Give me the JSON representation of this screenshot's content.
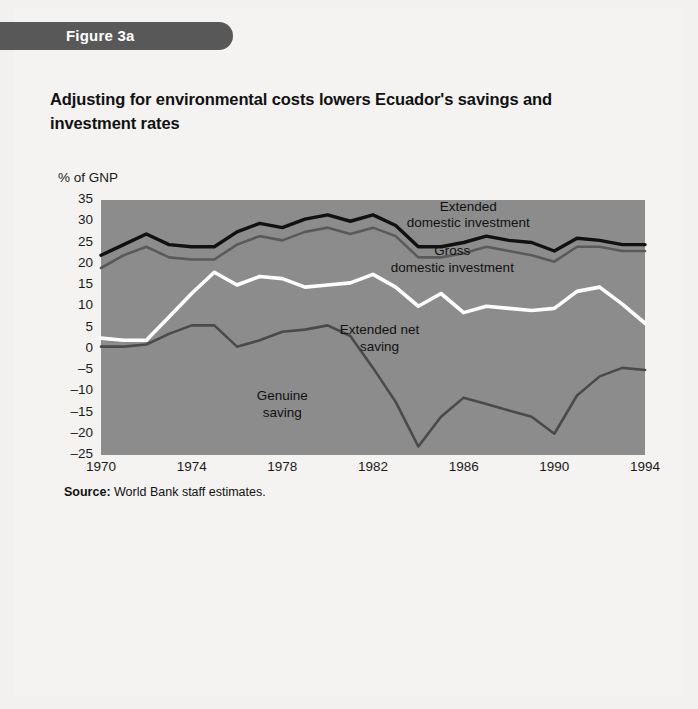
{
  "figure": {
    "tab_label": "Figure 3a",
    "title": "Adjusting for environmental costs lowers Ecuador's savings and investment rates",
    "source_prefix": "Source:",
    "source_text": "World Bank staff estimates."
  },
  "colors": {
    "tab_background": "#585858",
    "plot_background": "#8c8c8c",
    "extended_domestic_investment": "#111111",
    "gross_domestic_investment": "#5a5a5a",
    "extended_net_saving": "#ffffff",
    "genuine_saving": "#4a4a4a",
    "page_background": "#f4f3f1",
    "text": "#111111"
  },
  "chart_data": {
    "type": "line",
    "title": "Adjusting for environmental costs lowers Ecuador's savings and investment rates",
    "subtitle": "",
    "xlabel": "",
    "ylabel": "% of GNP",
    "ylim": [
      -25,
      35
    ],
    "xlim": [
      1970,
      1994
    ],
    "grid": false,
    "legend_position": "inline-annotations",
    "ytick_labels": [
      "35",
      "30",
      "25",
      "20",
      "15",
      "10",
      "5",
      "0",
      "–5",
      "–10",
      "–15",
      "–20",
      "–25"
    ],
    "ytick_values": [
      35,
      30,
      25,
      20,
      15,
      10,
      5,
      0,
      -5,
      -10,
      -15,
      -20,
      -25
    ],
    "xtick_labels": [
      "1970",
      "1974",
      "1978",
      "1982",
      "1986",
      "1990",
      "1994"
    ],
    "xtick_values": [
      1970,
      1974,
      1978,
      1982,
      1986,
      1990,
      1994
    ],
    "x": [
      1970,
      1971,
      1972,
      1973,
      1974,
      1975,
      1976,
      1977,
      1978,
      1979,
      1980,
      1981,
      1982,
      1983,
      1984,
      1985,
      1986,
      1987,
      1988,
      1989,
      1990,
      1991,
      1992,
      1993,
      1994
    ],
    "series": [
      {
        "name": "Extended domestic investment",
        "color": "#111111",
        "values": [
          22.0,
          24.5,
          27.0,
          24.5,
          24.0,
          24.0,
          27.5,
          29.5,
          28.5,
          30.5,
          31.5,
          30.0,
          31.5,
          29.0,
          24.0,
          24.0,
          25.0,
          26.5,
          25.5,
          25.0,
          23.0,
          26.0,
          25.5,
          24.5,
          24.5
        ]
      },
      {
        "name": "Gross domestic investment",
        "color": "#5a5a5a",
        "values": [
          19.0,
          22.0,
          24.0,
          21.5,
          21.0,
          21.0,
          24.5,
          26.5,
          25.5,
          27.5,
          28.5,
          27.0,
          28.5,
          26.5,
          21.5,
          21.5,
          22.5,
          24.0,
          23.0,
          22.0,
          20.5,
          24.0,
          24.0,
          23.0,
          23.0
        ]
      },
      {
        "name": "Extended net saving",
        "color": "#ffffff",
        "values": [
          2.5,
          2.0,
          2.0,
          7.5,
          13.0,
          18.0,
          15.0,
          17.0,
          16.5,
          14.5,
          15.0,
          15.5,
          17.5,
          14.5,
          10.0,
          13.0,
          8.5,
          10.0,
          9.5,
          9.0,
          9.5,
          13.5,
          14.5,
          10.5,
          6.0
        ]
      },
      {
        "name": "Genuine saving",
        "color": "#4a4a4a",
        "values": [
          0.5,
          0.5,
          1.0,
          3.5,
          5.5,
          5.5,
          0.5,
          2.0,
          4.0,
          4.5,
          5.5,
          3.0,
          -4.5,
          -12.5,
          -23.0,
          -16.0,
          -11.5,
          -13.0,
          -14.5,
          -16.0,
          -20.0,
          -11.0,
          -6.5,
          -4.5,
          -5.0
        ]
      }
    ],
    "annotations": [
      {
        "text": "Extended\ndomestic investment",
        "x": 1986.2,
        "y": 33.0
      },
      {
        "text": "Gross\ndomestic investment",
        "x": 1985.5,
        "y": 22.5
      },
      {
        "text": "Extended net\nsaving",
        "x": 1982.3,
        "y": 4.0
      },
      {
        "text": "Genuine\nsaving",
        "x": 1978.0,
        "y": -11.5
      }
    ]
  }
}
